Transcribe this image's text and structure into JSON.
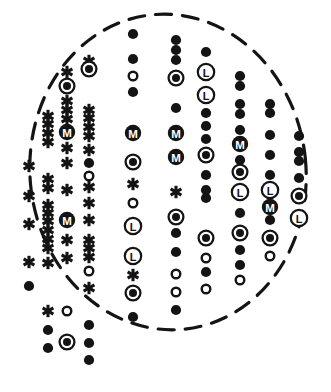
{
  "figure": {
    "canvas": {
      "width": 331,
      "height": 392
    },
    "colors": {
      "ink": "#141414",
      "background": "#ffffff",
      "boundary": "#141414"
    },
    "boundary": {
      "shape": "ellipse-dashed",
      "cx": 168,
      "cy": 172,
      "rx": 138,
      "ry": 158,
      "rotation": -6,
      "stroke_width": 3.2,
      "dash": "16 11"
    },
    "legend": {
      "symbols": [
        {
          "key": "asterisk",
          "glyph": "asterisk-icon",
          "label": "asterisk"
        },
        {
          "key": "filled",
          "glyph": "filled-circle-icon",
          "label": "filled circle"
        },
        {
          "key": "open",
          "glyph": "open-circle-icon",
          "label": "open circle"
        },
        {
          "key": "bullseye",
          "glyph": "bullseye-icon",
          "label": "ringed filled circle"
        },
        {
          "key": "M",
          "glyph": "circled-m-icon",
          "label": "circled M"
        },
        {
          "key": "L",
          "glyph": "circled-l-icon",
          "label": "circled L"
        }
      ]
    },
    "columns": [
      {
        "name": "column-1",
        "x": 29,
        "markers": [
          {
            "y": 166,
            "type": "asterisk"
          },
          {
            "y": 196,
            "type": "asterisk"
          },
          {
            "y": 224,
            "type": "asterisk"
          },
          {
            "y": 262,
            "type": "asterisk"
          },
          {
            "y": 286,
            "type": "filled"
          }
        ]
      },
      {
        "name": "column-2",
        "x": 48,
        "markers": [
          {
            "y": 116,
            "type": "asterisk"
          },
          {
            "y": 124,
            "type": "asterisk"
          },
          {
            "y": 133,
            "type": "asterisk"
          },
          {
            "y": 142,
            "type": "asterisk"
          },
          {
            "y": 179,
            "type": "asterisk"
          },
          {
            "y": 188,
            "type": "asterisk"
          },
          {
            "y": 205,
            "type": "asterisk"
          },
          {
            "y": 213,
            "type": "asterisk"
          },
          {
            "y": 221,
            "type": "asterisk"
          },
          {
            "y": 230,
            "type": "asterisk"
          },
          {
            "y": 239,
            "type": "asterisk"
          },
          {
            "y": 248,
            "type": "asterisk"
          },
          {
            "y": 263,
            "type": "asterisk"
          },
          {
            "y": 311,
            "type": "asterisk"
          },
          {
            "y": 330,
            "type": "filled"
          },
          {
            "y": 348,
            "type": "filled"
          }
        ]
      },
      {
        "name": "column-3",
        "x": 67,
        "markers": [
          {
            "y": 72,
            "type": "asterisk"
          },
          {
            "y": 86,
            "type": "bullseye"
          },
          {
            "y": 101,
            "type": "asterisk"
          },
          {
            "y": 110,
            "type": "asterisk"
          },
          {
            "y": 119,
            "type": "asterisk"
          },
          {
            "y": 132,
            "type": "M"
          },
          {
            "y": 148,
            "type": "asterisk"
          },
          {
            "y": 163,
            "type": "asterisk"
          },
          {
            "y": 190,
            "type": "asterisk"
          },
          {
            "y": 220,
            "type": "M"
          },
          {
            "y": 240,
            "type": "asterisk"
          },
          {
            "y": 258,
            "type": "asterisk"
          },
          {
            "y": 311,
            "type": "open"
          },
          {
            "y": 342,
            "type": "bullseye"
          }
        ]
      },
      {
        "name": "column-4",
        "x": 89,
        "markers": [
          {
            "y": 61,
            "type": "asterisk"
          },
          {
            "y": 69,
            "type": "bullseye"
          },
          {
            "y": 110,
            "type": "asterisk"
          },
          {
            "y": 118,
            "type": "asterisk"
          },
          {
            "y": 127,
            "type": "asterisk"
          },
          {
            "y": 136,
            "type": "asterisk"
          },
          {
            "y": 150,
            "type": "asterisk"
          },
          {
            "y": 163,
            "type": "filled"
          },
          {
            "y": 176,
            "type": "open"
          },
          {
            "y": 187,
            "type": "asterisk"
          },
          {
            "y": 203,
            "type": "asterisk"
          },
          {
            "y": 220,
            "type": "asterisk"
          },
          {
            "y": 240,
            "type": "asterisk"
          },
          {
            "y": 248,
            "type": "asterisk"
          },
          {
            "y": 257,
            "type": "asterisk"
          },
          {
            "y": 271,
            "type": "open"
          },
          {
            "y": 288,
            "type": "asterisk"
          },
          {
            "y": 325,
            "type": "filled"
          },
          {
            "y": 343,
            "type": "filled"
          },
          {
            "y": 360,
            "type": "filled"
          }
        ]
      },
      {
        "name": "column-5",
        "x": 133,
        "markers": [
          {
            "y": 34,
            "type": "filled"
          },
          {
            "y": 59,
            "type": "filled"
          },
          {
            "y": 76,
            "type": "open"
          },
          {
            "y": 92,
            "type": "filled"
          },
          {
            "y": 133,
            "type": "M"
          },
          {
            "y": 162,
            "type": "bullseye"
          },
          {
            "y": 184,
            "type": "asterisk"
          },
          {
            "y": 203,
            "type": "open"
          },
          {
            "y": 226,
            "type": "L"
          },
          {
            "y": 256,
            "type": "L"
          },
          {
            "y": 275,
            "type": "asterisk"
          },
          {
            "y": 293,
            "type": "bullseye"
          },
          {
            "y": 317,
            "type": "filled"
          }
        ]
      },
      {
        "name": "column-6",
        "x": 176,
        "markers": [
          {
            "y": 40,
            "type": "filled"
          },
          {
            "y": 50,
            "type": "filled"
          },
          {
            "y": 60,
            "type": "filled"
          },
          {
            "y": 78,
            "type": "bullseye"
          },
          {
            "y": 108,
            "type": "filled"
          },
          {
            "y": 133,
            "type": "M"
          },
          {
            "y": 157,
            "type": "M"
          },
          {
            "y": 192,
            "type": "asterisk"
          },
          {
            "y": 217,
            "type": "bullseye"
          },
          {
            "y": 233,
            "type": "filled"
          },
          {
            "y": 252,
            "type": "filled"
          },
          {
            "y": 274,
            "type": "open"
          },
          {
            "y": 292,
            "type": "open"
          },
          {
            "y": 310,
            "type": "filled"
          }
        ]
      },
      {
        "name": "column-7",
        "x": 206,
        "markers": [
          {
            "y": 52,
            "type": "filled"
          },
          {
            "y": 72,
            "type": "L"
          },
          {
            "y": 95,
            "type": "L"
          },
          {
            "y": 113,
            "type": "filled"
          },
          {
            "y": 126,
            "type": "filled"
          },
          {
            "y": 139,
            "type": "filled"
          },
          {
            "y": 155,
            "type": "bullseye"
          },
          {
            "y": 175,
            "type": "filled"
          },
          {
            "y": 190,
            "type": "filled"
          },
          {
            "y": 198,
            "type": "filled"
          },
          {
            "y": 238,
            "type": "bullseye"
          },
          {
            "y": 258,
            "type": "open"
          },
          {
            "y": 272,
            "type": "filled"
          },
          {
            "y": 289,
            "type": "open"
          }
        ]
      },
      {
        "name": "column-8",
        "x": 240,
        "markers": [
          {
            "y": 76,
            "type": "filled"
          },
          {
            "y": 86,
            "type": "filled"
          },
          {
            "y": 104,
            "type": "filled"
          },
          {
            "y": 114,
            "type": "filled"
          },
          {
            "y": 130,
            "type": "filled"
          },
          {
            "y": 144,
            "type": "M"
          },
          {
            "y": 160,
            "type": "filled"
          },
          {
            "y": 172,
            "type": "bullseye"
          },
          {
            "y": 192,
            "type": "L"
          },
          {
            "y": 213,
            "type": "filled"
          },
          {
            "y": 233,
            "type": "bullseye"
          },
          {
            "y": 250,
            "type": "filled"
          },
          {
            "y": 265,
            "type": "filled"
          },
          {
            "y": 280,
            "type": "open"
          }
        ]
      },
      {
        "name": "column-9",
        "x": 270,
        "markers": [
          {
            "y": 104,
            "type": "filled"
          },
          {
            "y": 113,
            "type": "filled"
          },
          {
            "y": 135,
            "type": "filled"
          },
          {
            "y": 155,
            "type": "filled"
          },
          {
            "y": 175,
            "type": "filled"
          },
          {
            "y": 190,
            "type": "L"
          },
          {
            "y": 207,
            "type": "M"
          },
          {
            "y": 220,
            "type": "filled"
          },
          {
            "y": 238,
            "type": "bullseye"
          },
          {
            "y": 256,
            "type": "open"
          }
        ]
      },
      {
        "name": "column-10",
        "x": 299,
        "markers": [
          {
            "y": 136,
            "type": "filled"
          },
          {
            "y": 152,
            "type": "filled"
          },
          {
            "y": 161,
            "type": "filled"
          },
          {
            "y": 178,
            "type": "filled"
          },
          {
            "y": 196,
            "type": "bullseye"
          },
          {
            "y": 218,
            "type": "L"
          }
        ]
      }
    ]
  }
}
